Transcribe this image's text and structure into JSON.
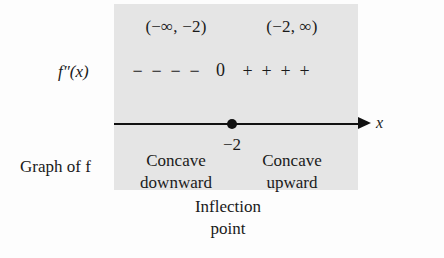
{
  "diagram": {
    "panel_color": "#e5e5e5",
    "line_color": "#111111"
  },
  "intervals": {
    "left_label": "(−∞, −2)",
    "right_label": "(−2, ∞)"
  },
  "function_row": {
    "label": "f″(x)",
    "left_signs": [
      "−",
      "−",
      "−",
      "−"
    ],
    "zero": "0",
    "right_signs": [
      "+",
      "+",
      "+",
      "+"
    ]
  },
  "axis": {
    "variable_label": "x",
    "critical_value": "−2",
    "arrow_direction": "right"
  },
  "graph_labels": {
    "left_caption": "Graph of f",
    "concave_down_line1": "Concave",
    "concave_down_line2": "downward",
    "concave_up_line1": "Concave",
    "concave_up_line2": "upward"
  },
  "caption": {
    "line1": "Inflection",
    "line2": "point"
  },
  "chart_data": {
    "type": "table",
    "categories": [
      "(−∞, −2)",
      "(−2, ∞)"
    ],
    "rows": [
      {
        "interval": "(−∞, −2)",
        "sign_of_f_double_prime": "−",
        "concavity": "Concave downward"
      },
      {
        "interval": "(−2, ∞)",
        "sign_of_f_double_prime": "+",
        "concavity": "Concave upward"
      }
    ],
    "critical_points": [
      {
        "x": -2,
        "f_double_prime": 0,
        "classification": "Inflection point"
      }
    ],
    "xlabel": "x",
    "ylabel": "",
    "grid": false,
    "legend": "none"
  }
}
